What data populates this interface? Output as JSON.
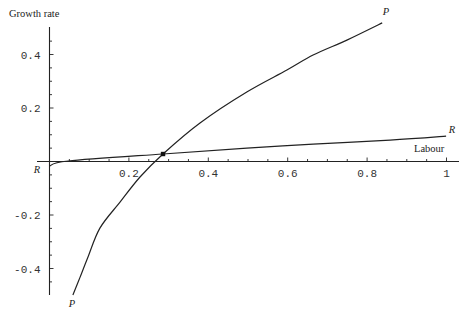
{
  "chart_data": {
    "type": "line",
    "title": "",
    "xlabel": "Labour",
    "ylabel": "Growth rate",
    "xlim": [
      0,
      1.03
    ],
    "ylim": [
      -0.5,
      0.5
    ],
    "grid": false,
    "legend": null,
    "x_ticks": [
      {
        "value": 0.2,
        "label": "0.2"
      },
      {
        "value": 0.4,
        "label": "0.4"
      },
      {
        "value": 0.6,
        "label": "0.6"
      },
      {
        "value": 0.8,
        "label": "0.8"
      },
      {
        "value": 1.0,
        "label": "1"
      }
    ],
    "y_ticks": [
      {
        "value": 0.4,
        "label": "0.4"
      },
      {
        "value": 0.2,
        "label": "0.2"
      },
      {
        "value": -0.2,
        "label": "-0.2"
      },
      {
        "value": -0.4,
        "label": "-0.4"
      }
    ],
    "series": [
      {
        "name": "P",
        "x": [
          0.059,
          0.077,
          0.097,
          0.127,
          0.178,
          0.228,
          0.286,
          0.379,
          0.497,
          0.598,
          0.664,
          0.749,
          0.838
        ],
        "y": [
          -0.499,
          -0.432,
          -0.357,
          -0.249,
          -0.151,
          -0.058,
          0.028,
          0.144,
          0.26,
          0.342,
          0.398,
          0.454,
          0.518
        ],
        "label_start": "P",
        "label_end": "P"
      },
      {
        "name": "R",
        "x": [
          0.0,
          0.047,
          0.286,
          0.497,
          0.664,
          0.858,
          0.999
        ],
        "y": [
          -0.017,
          0.002,
          0.028,
          0.05,
          0.065,
          0.08,
          0.095
        ],
        "label_start": "R",
        "label_end": "R"
      }
    ],
    "annotations": [
      {
        "type": "point",
        "x": 0.286,
        "y": 0.028,
        "note": "intersection of P and R"
      }
    ]
  }
}
